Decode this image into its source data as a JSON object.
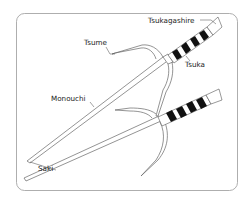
{
  "diagram": {
    "labels": {
      "tsukagashire": "Tsukagashire",
      "tsume": "Tsume",
      "tsuka": "Tsuka",
      "monouchi": "Monouchi",
      "saki": "Saki"
    },
    "colors": {
      "outline": "#888888",
      "line": "#555555",
      "grip": "#111111"
    }
  }
}
